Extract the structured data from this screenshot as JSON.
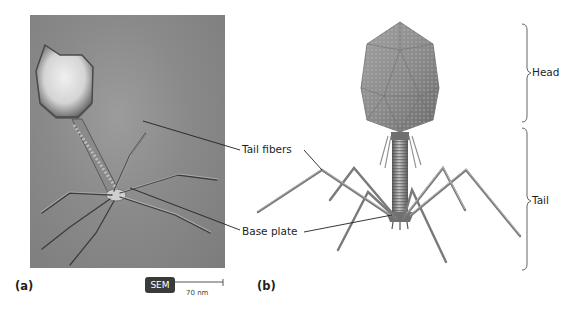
{
  "figure": {
    "panels": [
      {
        "letter": "(a)",
        "description": "SEM micrograph of bacteriophage T4"
      },
      {
        "letter": "(b)",
        "description": "Illustration of bacteriophage T4 structure"
      }
    ],
    "micrograph": {
      "badge": "SEM",
      "scale_bar_label": "70 nm"
    },
    "callouts": {
      "tail_fibers": "Tail fibers",
      "base_plate": "Base plate"
    },
    "brackets": {
      "head": "Head",
      "tail": "Tail"
    },
    "colors": {
      "background": "#ffffff",
      "text": "#231f20",
      "leader_line": "#231f20",
      "badge_bg": "#3a3a3a",
      "photo_gray": "#8a8a8a",
      "capsid_gray": "#8c8c8c"
    }
  }
}
